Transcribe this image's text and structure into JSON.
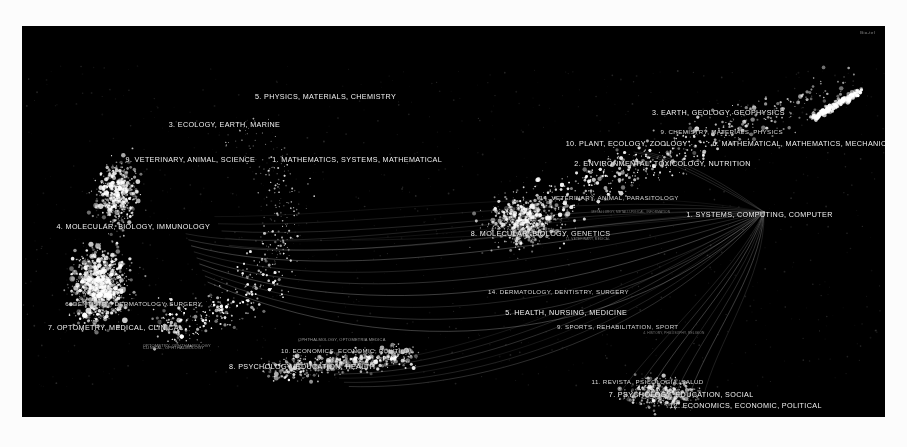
{
  "figure": {
    "type": "science-map",
    "background_color": "#000000",
    "page_background": "#fcfcfc",
    "point_color": "#ffffff",
    "edge_color": "#cfcfcf",
    "width": 863,
    "height": 391,
    "watermark": "Bio-tel"
  },
  "chart_data": {
    "type": "scatter",
    "title": "",
    "subtitle": "",
    "xlabel": "",
    "ylabel": "",
    "grid": false,
    "legend_position": "none",
    "clusters_left": [
      {
        "id": 5,
        "label": "5. PHYSICS, MATERIALS, CHEMISTRY",
        "x": 0.27,
        "y": 0.17,
        "size": "major"
      },
      {
        "id": 3,
        "label": "3. ECOLOGY, EARTH, MARINE",
        "x": 0.17,
        "y": 0.24,
        "size": "major"
      },
      {
        "id": 1,
        "label": "1. MATHEMATICS, SYSTEMS, MATHEMATICAL",
        "x": 0.29,
        "y": 0.33,
        "size": "major"
      },
      {
        "id": 9,
        "label": "9. VETERINARY, ANIMAL, SCIENCE",
        "x": 0.12,
        "y": 0.33,
        "size": "major"
      },
      {
        "id": 4,
        "label": "4. MOLECULAR, BIOLOGY, IMMUNOLOGY",
        "x": 0.04,
        "y": 0.5,
        "size": "major"
      },
      {
        "id": 6,
        "label": "6. DENTISTRY, DERMATOLOGY, SURGERY",
        "x": 0.05,
        "y": 0.7,
        "size": "mid"
      },
      {
        "id": 7,
        "label": "7. OPTOMETRY, MEDICAL, CLINICAL",
        "x": 0.03,
        "y": 0.76,
        "size": "major"
      },
      {
        "id": 0,
        "label": "OPTOMETRY, OPHTHALMOLOGY",
        "x": 0.14,
        "y": 0.81,
        "size": "minor"
      },
      {
        "id": 8,
        "label": "8. PSYCHOLOGY, EDUCATION, HEALTH",
        "x": 0.24,
        "y": 0.86,
        "size": "major"
      },
      {
        "id": 10,
        "label": "10. ECONOMICS, ECONOMIC, POLITICAL",
        "x": 0.3,
        "y": 0.82,
        "size": "mid"
      }
    ],
    "clusters_right": [
      {
        "id": 3,
        "label": "3. EARTH, GEOLOGY, GEOPHYSICS",
        "x": 0.73,
        "y": 0.21,
        "size": "major"
      },
      {
        "id": 9,
        "label": "9. CHEMISTRY, MATERIALS, PHYSICS",
        "x": 0.74,
        "y": 0.26,
        "size": "mid"
      },
      {
        "id": 6,
        "label": "6. MATHEMATICAL, MATHEMATICS, MECHANICS",
        "x": 0.8,
        "y": 0.29,
        "size": "major"
      },
      {
        "id": 10,
        "label": "10. PLANT, ECOLOGY, ZOOLOGY",
        "x": 0.63,
        "y": 0.29,
        "size": "major"
      },
      {
        "id": 2,
        "label": "2. ENVIRONMENTAL, TOXICOLOGY, NUTRITION",
        "x": 0.64,
        "y": 0.34,
        "size": "major"
      },
      {
        "id": 14,
        "label": "14. VETERINARY, ANIMAL, PARASITOLOGY",
        "x": 0.6,
        "y": 0.43,
        "size": "mid"
      },
      {
        "id": 0,
        "label": "METALLURGY, METALLURGICAL, INFORMATION",
        "x": 0.66,
        "y": 0.47,
        "size": "tiny"
      },
      {
        "id": 1,
        "label": "1. SYSTEMS, COMPUTING, COMPUTER",
        "x": 0.77,
        "y": 0.47,
        "size": "major"
      },
      {
        "id": 8,
        "label": "8. MOLECULAR, BIOLOGY, GENETICS",
        "x": 0.52,
        "y": 0.52,
        "size": "major"
      },
      {
        "id": 11,
        "label": "11. VETERINARY, MEDICAL",
        "x": 0.63,
        "y": 0.54,
        "size": "tiny"
      },
      {
        "id": 14,
        "label": "14. DERMATOLOGY, DENTISTRY, SURGERY",
        "x": 0.54,
        "y": 0.67,
        "size": "mid"
      },
      {
        "id": 5,
        "label": "5. HEALTH, NURSING, MEDICINE",
        "x": 0.56,
        "y": 0.72,
        "size": "major"
      },
      {
        "id": 9,
        "label": "9. SPORTS, REHABILITATION, SPORT",
        "x": 0.62,
        "y": 0.76,
        "size": "mid"
      },
      {
        "id": 4,
        "label": "4. HISTORY, PHILOSOPHY, RELIGION",
        "x": 0.72,
        "y": 0.78,
        "size": "tiny"
      },
      {
        "id": 11,
        "label": "11. REVISTA, PSICOLOGIA, SALUD",
        "x": 0.66,
        "y": 0.9,
        "size": "mid"
      },
      {
        "id": 7,
        "label": "7. PSYCHOLOGY, EDUCATION, SOCIAL",
        "x": 0.68,
        "y": 0.93,
        "size": "major"
      },
      {
        "id": 12,
        "label": "12. ECONOMICS, ECONOMIC, POLITICAL",
        "x": 0.75,
        "y": 0.96,
        "size": "major"
      }
    ],
    "small_labels_left": [
      {
        "label": "CLINICAL, OPHTHALMOLOGY",
        "x": 0.14,
        "y": 0.815
      }
    ],
    "small_labels_right": [
      {
        "label": "OPHTHALMOLOGY, OPTOMETRIA MEDICA",
        "x": 0.32,
        "y": 0.795
      }
    ],
    "point_clouds": [
      {
        "name": "left-cloud",
        "cx": 0.12,
        "cy": 0.55,
        "n": 1400,
        "note": "dense crescent arc from upper-right sweeping down to lower-left"
      },
      {
        "name": "right-cloud",
        "cx": 0.7,
        "cy": 0.35,
        "n": 1000,
        "note": "diagonal band running upper-right to lower-left"
      },
      {
        "name": "lower-center",
        "cx": 0.33,
        "cy": 0.88,
        "n": 400,
        "note": "small elongated cluster near psychology labels"
      },
      {
        "name": "lower-right",
        "cx": 0.72,
        "cy": 0.94,
        "n": 300,
        "note": "cluster near economics / psychology labels"
      }
    ],
    "edge_bundles": [
      {
        "from": "right-hub",
        "to": "left-cloud",
        "count": 9,
        "style": "long curved bundle spanning the figure"
      },
      {
        "from": "right-hub",
        "to": "lower-right",
        "count": 6,
        "style": "short fan of straight lines"
      }
    ]
  }
}
